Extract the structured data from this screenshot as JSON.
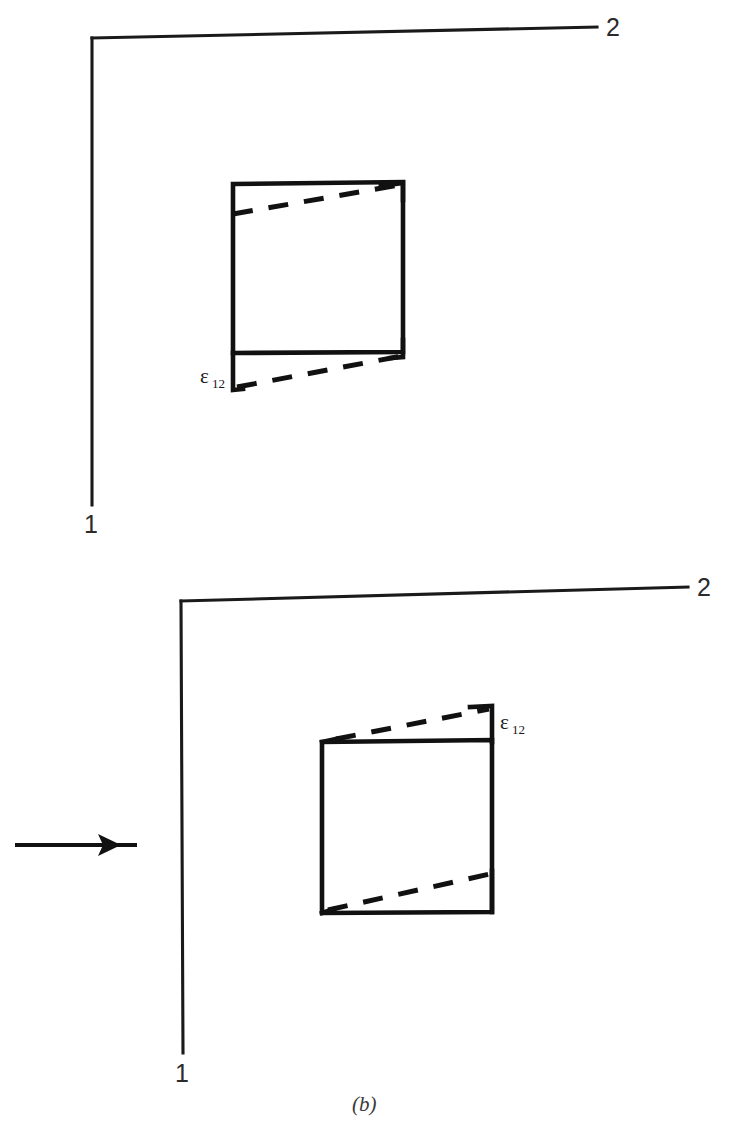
{
  "figure": {
    "caption": "(b)",
    "background_color": "#ffffff",
    "ink_color": "#111111",
    "width": 729,
    "height": 1142
  },
  "panels": [
    {
      "id": "upper-panel",
      "role": "undeformed-reference-state",
      "axes": {
        "vertical_label": "1",
        "horizontal_label": "2",
        "origin_x": 92,
        "origin_y": 38,
        "vertical_end_x": 92,
        "vertical_end_y": 505,
        "horizontal_end_x": 597,
        "horizontal_end_y": 27
      },
      "element": {
        "type": "square-solid",
        "top_left": [
          233,
          184
        ],
        "top_right": [
          403,
          182
        ],
        "bottom_right": [
          403,
          352
        ],
        "bottom_left": [
          233,
          353
        ]
      },
      "deformed_outline": {
        "type": "dashed",
        "upper_edge": [
          [
            233,
            213
          ],
          [
            399,
            185
          ]
        ],
        "lower_edge": [
          [
            235,
            386
          ],
          [
            402,
            356
          ]
        ]
      },
      "strain_label": {
        "symbol": "ε",
        "subscript": "12",
        "x": 206,
        "y": 381
      },
      "brackets": [
        {
          "name": "upper-left-tick",
          "points": "233,184 233,216"
        },
        {
          "name": "lower-left-tick",
          "points": "233,353 233,389 241,389"
        },
        {
          "name": "upper-right-tick",
          "points": "403,182 380,186"
        },
        {
          "name": "lower-right-tick",
          "points": "403,352 403,359"
        }
      ]
    },
    {
      "id": "lower-panel",
      "role": "deformed-sheared-state",
      "axes": {
        "vertical_label": "1",
        "horizontal_label": "2",
        "origin_x": 181,
        "origin_y": 601,
        "vertical_end_x": 183,
        "vertical_end_y": 1053,
        "horizontal_end_x": 688,
        "horizontal_end_y": 587
      },
      "element": {
        "type": "square-solid",
        "top_left": [
          322,
          742
        ],
        "top_right": [
          492,
          740
        ],
        "bottom_right": [
          492,
          912
        ],
        "bottom_left": [
          322,
          913
        ]
      },
      "deformed_outline": {
        "type": "dashed",
        "upper_edge": [
          [
            334,
            739
          ],
          [
            490,
            708
          ]
        ],
        "lower_edge": [
          [
            326,
            911
          ],
          [
            490,
            874
          ]
        ]
      },
      "strain_label": {
        "symbol": "ε",
        "subscript": "12",
        "x": 499,
        "y": 727
      },
      "brackets": [
        {
          "name": "upper-left-tick",
          "points": "322,742 330,740"
        },
        {
          "name": "upper-right-tick",
          "points": "469,706 492,706 492,742"
        },
        {
          "name": "lower-right-tick",
          "points": "492,871 492,912"
        },
        {
          "name": "lower-left-tick",
          "points": "322,913 330,910"
        }
      ],
      "shear_arrow": {
        "name": "shear-direction-arrow",
        "x_start": 15,
        "x_end": 137,
        "y": 845
      }
    }
  ]
}
